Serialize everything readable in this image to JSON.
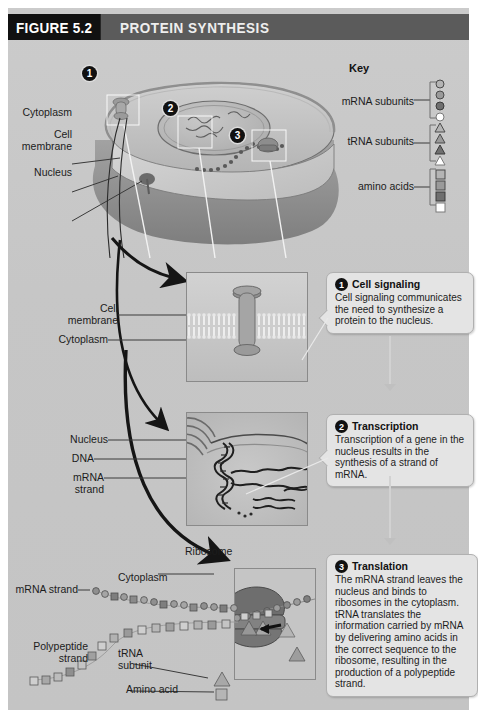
{
  "header": {
    "figure_number": "FIGURE 5.2",
    "title": "PROTEIN SYNTHESIS"
  },
  "key": {
    "title": "Key",
    "entries": [
      {
        "label": "mRNA subunits",
        "shape": "circle"
      },
      {
        "label": "tRNA subunits",
        "shape": "triangle"
      },
      {
        "label": "amino acids",
        "shape": "square"
      }
    ],
    "shades": [
      "#b4b4b4",
      "#9a9a9a",
      "#6f6f6f",
      "#ffffff"
    ]
  },
  "cell_labels": {
    "cytoplasm": "Cytoplasm",
    "cell_membrane": "Cell\nmembrane",
    "nucleus": "Nucleus"
  },
  "callout_markers": [
    "1",
    "2",
    "3"
  ],
  "steps": [
    {
      "number": "1",
      "title": "Cell signaling",
      "text": "Cell signaling communicates the need to synthesize a protein to the nucleus.",
      "panel_labels": [
        "Cell\nmembrane",
        "Cytoplasm"
      ]
    },
    {
      "number": "2",
      "title": "Transcription",
      "text": "Transcription of a gene in the nucleus results in the synthesis of a strand of mRNA.",
      "panel_labels": [
        "Nucleus",
        "DNA",
        "mRNA\nstrand"
      ]
    },
    {
      "number": "3",
      "title": "Translation",
      "text": "The mRNA strand leaves the nucleus and binds to ribosomes in the cytoplasm. tRNA translates the information carried by mRNA by delivering amino acids in the correct sequence to the ribosome, resulting in the production of a polypeptide strand.",
      "panel_labels": [
        "Ribosome",
        "Cytoplasm",
        "mRNA strand",
        "Polypeptide\nstrand",
        "tRNA\nsubunit",
        "Amino acid"
      ]
    }
  ],
  "bottom_labels": {
    "mrna_strand": "mRNA strand",
    "cytoplasm": "Cytoplasm",
    "ribosome": "Ribosome",
    "polypeptide_strand": "Polypeptide\nstrand",
    "trna_subunit": "tRNA\nsubunit",
    "amino_acid": "Amino acid"
  },
  "colors": {
    "plate": "#c9c9c9",
    "header_bar": "#5b5b5b",
    "header_block": "#111111",
    "callout_bg": "#e4e4e4",
    "ink": "#1c1c1c",
    "cell_top": "#c0c0c0",
    "cell_side": "#8e8e8e"
  }
}
